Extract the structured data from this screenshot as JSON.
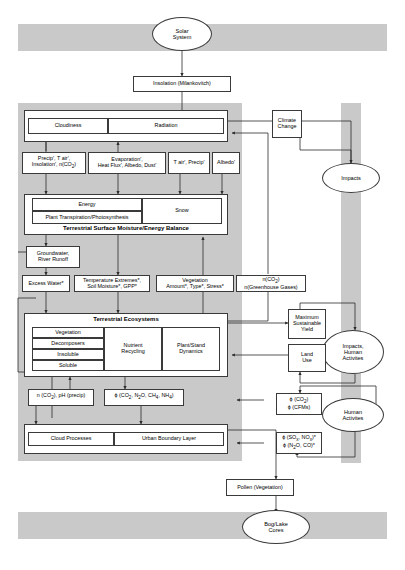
{
  "diagram": {
    "colors": {
      "band": "#c9c9c9",
      "stroke": "#3a3a3a",
      "fill": "#ffffff",
      "text": "#000000"
    },
    "bands": [
      {
        "name": "solar-system-band"
      },
      {
        "name": "atmosphere-band"
      },
      {
        "name": "right-column-band"
      },
      {
        "name": "bog-lake-band"
      }
    ],
    "nodes": {
      "solar_system": "Solar\nSystem",
      "solar_system_l1": "Solar",
      "solar_system_l2": "System",
      "insolation": "Insolation (Milankovitch)",
      "cloudiness": "Cloudiness",
      "radiation": "Radiation",
      "precip_box_l1": "Precip′, T air′,",
      "precip_box_l2": "Insolation′, n(CO2)",
      "evap_box_l1": "Evaporation′,",
      "evap_box_l2": "Heat Flux′, Albedo, Dust′",
      "tair_precip": "T air′, Precip′",
      "albedo": "Albedo′",
      "energy": "Energy",
      "plant_transpiration": "Plant Transpiration/Photosynthesis",
      "snow": "Snow",
      "tsmeb_title": "Terrestrial Surface Moisture/Energy Balance",
      "groundwater_l1": "Groundwater,",
      "groundwater_l2": "River Runoff",
      "excess_water": "Excess Water*",
      "temp_extremes_l1": "Temperature Extremes*,",
      "temp_extremes_l2": "Soil Moisture*, GPP*",
      "vegetation_box_l1": "Vegetation",
      "vegetation_box_l2": "Amount*, Type*, Stress*",
      "nco2_box_l1": "n(CO2)",
      "nco2_box_l2": "n(Greenhouse Gases)",
      "terrestrial_ecosystems_title": "Terrestrial Ecosystems",
      "vegetation": "Vegetation",
      "decomposers": "Decomposers",
      "insoluble": "Insoluble",
      "soluble": "Soluble",
      "nutrient_recycling_l1": "Nutrient",
      "nutrient_recycling_l2": "Recycling",
      "plant_stand_l1": "Plant/Stand",
      "plant_stand_l2": "Dynamics",
      "n_co2_ph": "n (CO2), pH (precip)",
      "flux_co2_n2o": "ϕ (CO2, N2O, CH4, NH4)",
      "cloud_processes": "Cloud Processes",
      "urban_boundary_layer": "Urban Boundary Layer",
      "climate_change_l1": "Climate",
      "climate_change_l2": "Change",
      "impacts": "Impacts",
      "max_sustainable_l1": "Maximum",
      "max_sustainable_l2": "Sustainable",
      "max_sustainable_l3": "Yield",
      "land_use_l1": "Land",
      "land_use_l2": "Use",
      "impacts_human_l1": "Impacts,",
      "impacts_human_l2": "Human",
      "impacts_human_l3": "Activites",
      "flux_co2_l1": "ϕ (CO2)",
      "flux_co2_l2": "ϕ (CFMs)",
      "human_activities_l1": "Human",
      "human_activities_l2": "Activites",
      "flux_sox_l1": "ϕ (SOx, NOx)*",
      "flux_sox_l2": "ϕ (N2O, CO)*",
      "pollen": "Pollen (Vegetation)",
      "bog_lake_l1": "Bog/Lake",
      "bog_lake_l2": "Cores"
    }
  }
}
